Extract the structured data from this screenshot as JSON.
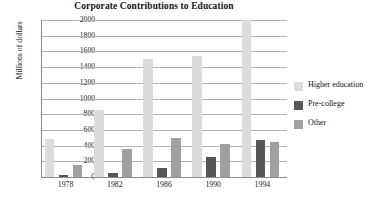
{
  "chart_data": {
    "type": "bar",
    "title": "Corporate Contributions to Education",
    "xlabel": "",
    "ylabel": "Millions of dollars",
    "categories": [
      "1978",
      "1982",
      "1986",
      "1990",
      "1994"
    ],
    "series": [
      {
        "name": "Higher education",
        "color": "#dcdcdc",
        "values": [
          490,
          855,
          1500,
          1540,
          2010
        ]
      },
      {
        "name": "Pre-college",
        "color": "#565656",
        "values": [
          20,
          55,
          110,
          260,
          475
        ]
      },
      {
        "name": "Other",
        "color": "#a0a0a0",
        "values": [
          150,
          360,
          495,
          425,
          440
        ]
      }
    ],
    "ylim": [
      0,
      2000
    ],
    "ytick_values": [
      0,
      200,
      400,
      600,
      800,
      1000,
      1200,
      1400,
      1600,
      1800,
      2000
    ],
    "ytick_labels": [
      "0",
      "200",
      "400",
      "600",
      "800",
      "1000",
      "1200",
      "1400",
      "1600",
      "1800",
      "2000"
    ],
    "grid": true,
    "grid_axis": "y",
    "legend_position": "right"
  },
  "legend": {
    "items": [
      {
        "label": "Higher education",
        "color": "#dcdcdc"
      },
      {
        "label": "Pre-college",
        "color": "#565656"
      },
      {
        "label": "Other",
        "color": "#a0a0a0"
      }
    ]
  },
  "caption": {
    "faint_text": ""
  }
}
